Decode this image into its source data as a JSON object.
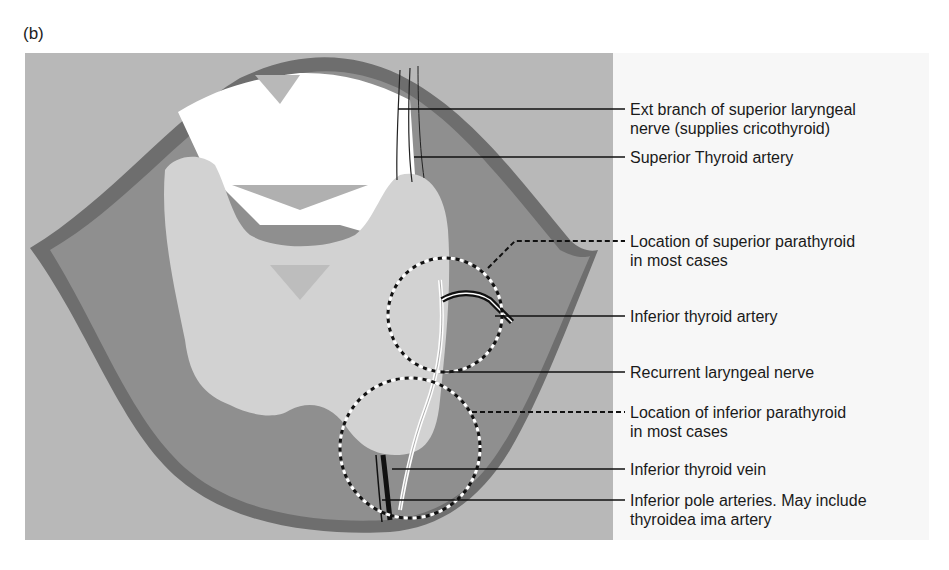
{
  "figure": {
    "panel_label": "(b)",
    "colors": {
      "background_tissue": "#b8b8b8",
      "muscle_band": "#6e6e6e",
      "deep_region": "#8f8f8f",
      "thyroid": "#d2d2d2",
      "cartilage": "#ffffff",
      "label_panel": "#f7f7f7"
    },
    "callouts": [
      {
        "id": "ext-branch-superior-laryngeal-nerve",
        "lines": [
          "Ext branch of superior laryngeal",
          "nerve (supplies cricothyroid)"
        ],
        "leader": "solid"
      },
      {
        "id": "superior-thyroid-artery",
        "lines": [
          "Superior Thyroid artery"
        ],
        "leader": "solid"
      },
      {
        "id": "superior-parathyroid-location",
        "lines": [
          "Location of superior parathyroid",
          "in most cases"
        ],
        "leader": "dashed"
      },
      {
        "id": "inferior-thyroid-artery",
        "lines": [
          "Inferior thyroid artery"
        ],
        "leader": "solid"
      },
      {
        "id": "recurrent-laryngeal-nerve",
        "lines": [
          "Recurrent laryngeal nerve"
        ],
        "leader": "solid"
      },
      {
        "id": "inferior-parathyroid-location",
        "lines": [
          "Location of inferior parathyroid",
          "in most cases"
        ],
        "leader": "dashed"
      },
      {
        "id": "inferior-thyroid-vein",
        "lines": [
          "Inferior thyroid vein"
        ],
        "leader": "solid"
      },
      {
        "id": "inferior-pole-arteries",
        "lines": [
          "Inferior pole arteries. May include",
          "thyroidea ima artery"
        ],
        "leader": "solid"
      }
    ]
  }
}
